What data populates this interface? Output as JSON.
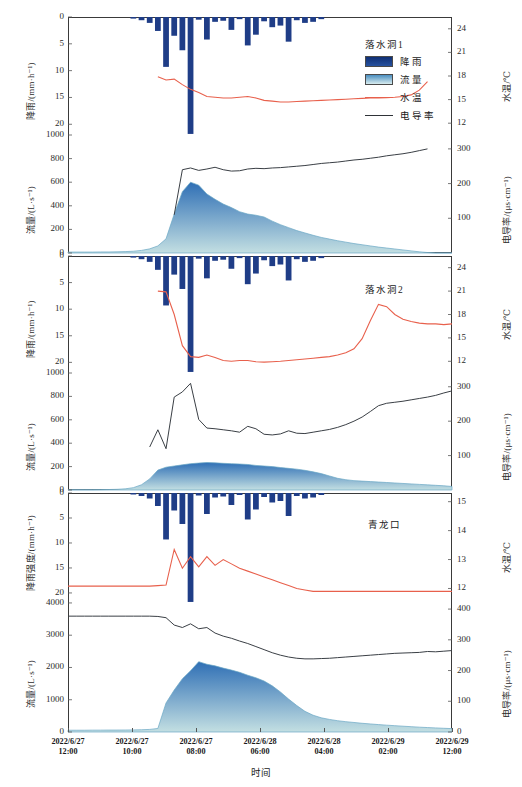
{
  "figure": {
    "width": 522,
    "height": 787,
    "x_axis_title": "时间",
    "x_ticks": [
      {
        "date": "2022/6/27",
        "time": "12:00"
      },
      {
        "date": "2022/6/27",
        "time": "10:00"
      },
      {
        "date": "2022/6/27",
        "time": "08:00"
      },
      {
        "date": "2022/6/28",
        "time": "06:00"
      },
      {
        "date": "2022/6/28",
        "time": "04:00"
      },
      {
        "date": "2022/6/29",
        "time": "02:00"
      },
      {
        "date": "2022/6/29",
        "time": "12:00"
      }
    ],
    "colors": {
      "rainfall": "#1f3d87",
      "flow_top": "#2f6fb5",
      "flow_bottom": "#c3dfe2",
      "water_temp": "#e8604c",
      "conductivity": "#3a3f45",
      "frame": "#3a3a3a"
    }
  },
  "legend": {
    "title": "落水洞1",
    "items": [
      {
        "label": "降雨",
        "type": "swatch",
        "color": "#1f3d87"
      },
      {
        "label": "流量",
        "type": "swatch",
        "color": "#9fcfe0"
      },
      {
        "label": "水温",
        "type": "line",
        "color": "#e8604c"
      },
      {
        "label": "电导率",
        "type": "line",
        "color": "#2f3338"
      }
    ]
  },
  "chart_data": {
    "type": "line",
    "xlabel": "时间",
    "x_range": [
      "2022/6/27 12:00",
      "2022/6/29 12:00"
    ],
    "panels": [
      {
        "name": "落水洞1",
        "axes": {
          "rain": {
            "label": "降雨/(mm·h⁻¹)",
            "ticks": [
              0,
              5,
              10,
              15,
              20
            ],
            "ylim": [
              0,
              22
            ],
            "inverted": true
          },
          "flow": {
            "label": "流量/(L·s⁻¹)",
            "ticks": [
              0,
              200,
              400,
              600,
              800,
              1000
            ],
            "ylim": [
              0,
              1000
            ]
          },
          "temp": {
            "label": "水温/℃",
            "ticks": [
              12,
              15,
              18,
              21,
              24
            ],
            "ylim": [
              10.5,
              25.5
            ],
            "inverted": true
          },
          "cond": {
            "label": "电导率/(μs·cm⁻¹)",
            "ticks": [
              100,
              200,
              300
            ],
            "ylim": [
              0,
              340
            ]
          }
        },
        "series": {
          "rainfall": {
            "unit": "mm/h",
            "values": [
              0,
              0,
              0,
              0,
              0,
              0,
              0,
              0,
              0.3,
              0.6,
              1.1,
              2.6,
              9.3,
              3.5,
              6.2,
              21.8,
              0.5,
              4.2,
              0.9,
              0.7,
              2.4,
              0.4,
              5.3,
              3.3,
              0.8,
              1.9,
              1.6,
              4.6,
              0.6,
              1.1,
              0.9,
              0.4,
              0,
              0,
              0,
              0,
              0,
              0,
              0,
              0,
              0,
              0,
              0,
              0,
              0,
              0,
              0,
              0
            ]
          },
          "flow": {
            "unit": "L/s",
            "values": [
              8,
              8,
              8,
              8,
              9,
              9,
              10,
              12,
              15,
              22,
              35,
              60,
              120,
              330,
              520,
              600,
              575,
              500,
              455,
              415,
              385,
              350,
              330,
              320,
              305,
              270,
              240,
              215,
              190,
              170,
              150,
              132,
              118,
              104,
              92,
              80,
              70,
              60,
              50,
              42,
              34,
              26,
              18,
              10,
              4,
              0,
              0,
              0
            ]
          },
          "water_temp": {
            "unit": "℃",
            "values": [
              null,
              null,
              null,
              null,
              null,
              null,
              null,
              null,
              null,
              null,
              null,
              17.9,
              17.5,
              17.6,
              16.9,
              16.3,
              15.9,
              15.4,
              15.3,
              15.2,
              15.2,
              15.3,
              15.4,
              15.2,
              14.9,
              14.8,
              14.7,
              14.7,
              14.75,
              14.8,
              14.85,
              14.9,
              14.95,
              15.0,
              15.05,
              15.1,
              15.15,
              15.2,
              15.2,
              15.25,
              15.3,
              15.4,
              15.6,
              16.2,
              17.3,
              null,
              null,
              null
            ]
          },
          "conductivity": {
            "unit": "μs/cm",
            "values": [
              null,
              null,
              null,
              null,
              null,
              null,
              null,
              null,
              null,
              null,
              null,
              null,
              null,
              110,
              240,
              245,
              238,
              242,
              247,
              240,
              236,
              237,
              242,
              244,
              243,
              245,
              246,
              248,
              250,
              252,
              255,
              258,
              260,
              262,
              265,
              268,
              270,
              273,
              276,
              280,
              283,
              286,
              290,
              295,
              300,
              null,
              null,
              null
            ]
          }
        }
      },
      {
        "name": "落水洞2",
        "axes": {
          "rain": {
            "label": "降雨/(mm·h⁻¹)",
            "ticks": [
              0,
              5,
              10,
              15,
              20
            ],
            "ylim": [
              0,
              22
            ],
            "inverted": true
          },
          "flow": {
            "label": "流量/(L·s⁻¹)",
            "ticks": [
              0,
              200,
              400,
              600,
              800,
              1000
            ],
            "ylim": [
              0,
              1000
            ]
          },
          "temp": {
            "label": "水温/℃",
            "ticks": [
              12,
              15,
              18,
              21,
              24
            ],
            "ylim": [
              10.5,
              25.5
            ],
            "inverted": true
          },
          "cond": {
            "label": "电导率/(μs·cm⁻¹)",
            "ticks": [
              100,
              200,
              300
            ],
            "ylim": [
              0,
              340
            ]
          }
        },
        "series": {
          "rainfall": {
            "unit": "mm/h",
            "values": [
              0,
              0,
              0,
              0,
              0,
              0,
              0,
              0,
              0.3,
              0.6,
              1.1,
              2.6,
              9.3,
              3.5,
              6.2,
              21.8,
              0.5,
              4.2,
              0.9,
              0.7,
              2.4,
              0.4,
              5.3,
              3.3,
              0.8,
              1.9,
              1.6,
              4.6,
              0.6,
              1.1,
              0.9,
              0.4,
              0,
              0,
              0,
              0,
              0,
              0,
              0,
              0,
              0,
              0,
              0,
              0,
              0,
              0,
              0,
              0
            ]
          },
          "flow": {
            "unit": "L/s",
            "values": [
              2,
              2,
              2,
              2,
              3,
              4,
              6,
              10,
              20,
              45,
              95,
              170,
              195,
              205,
              215,
              225,
              230,
              235,
              232,
              228,
              225,
              222,
              218,
              210,
              205,
              200,
              192,
              185,
              178,
              168,
              155,
              140,
              120,
              100,
              88,
              80,
              76,
              72,
              68,
              64,
              60,
              56,
              52,
              48,
              44,
              40,
              36,
              30
            ]
          },
          "water_temp": {
            "unit": "℃",
            "values": [
              null,
              null,
              null,
              null,
              null,
              null,
              null,
              null,
              null,
              null,
              null,
              21.0,
              20.9,
              18.0,
              14.0,
              12.6,
              12.5,
              12.8,
              12.5,
              12.1,
              12.0,
              12.1,
              12.1,
              11.95,
              11.9,
              11.95,
              12.0,
              12.1,
              12.2,
              12.3,
              12.4,
              12.5,
              12.6,
              12.8,
              13.1,
              13.6,
              14.9,
              17.2,
              19.3,
              19.0,
              18.0,
              17.4,
              17.1,
              16.9,
              16.8,
              16.8,
              16.7,
              16.8
            ]
          },
          "conductivity": {
            "unit": "μs/cm",
            "values": [
              null,
              null,
              null,
              null,
              null,
              null,
              null,
              null,
              null,
              null,
              125,
              175,
              120,
              270,
              285,
              310,
              205,
              180,
              178,
              175,
              172,
              168,
              185,
              178,
              162,
              160,
              163,
              172,
              165,
              164,
              168,
              172,
              176,
              182,
              190,
              200,
              212,
              228,
              245,
              252,
              255,
              258,
              262,
              266,
              270,
              275,
              282,
              288
            ]
          }
        }
      },
      {
        "name": "青龙口",
        "axes": {
          "rain": {
            "label": "降雨强度/(mm·h⁻¹)",
            "ticks": [
              0,
              5,
              10,
              15,
              20
            ],
            "ylim": [
              0,
              22
            ],
            "inverted": true
          },
          "flow": {
            "label": "流量/(L·s⁻¹)",
            "ticks": [
              0,
              1000,
              2000,
              3000,
              4000
            ],
            "ylim": [
              0,
              4000
            ]
          },
          "temp": {
            "label": "水温/℃",
            "ticks": [
              12,
              13,
              14,
              15
            ],
            "ylim": [
              11.5,
              15.3
            ],
            "inverted": true
          },
          "cond": {
            "label": "电导率/(μs·cm⁻¹)",
            "ticks": [
              0,
              100,
              200,
              300,
              400
            ],
            "ylim": [
              0,
              420
            ]
          }
        },
        "series": {
          "rainfall": {
            "unit": "mm/h",
            "values": [
              0,
              0,
              0,
              0,
              0,
              0,
              0,
              0,
              0.3,
              0.6,
              1.1,
              2.6,
              9.3,
              3.5,
              6.2,
              21.8,
              0.5,
              4.2,
              0.9,
              0.7,
              2.4,
              0.4,
              5.3,
              3.3,
              0.8,
              1.9,
              1.6,
              4.6,
              0.6,
              1.1,
              0.9,
              0.4,
              0,
              0,
              0,
              0,
              0,
              0,
              0,
              0,
              0,
              0,
              0,
              0,
              0,
              0,
              0,
              0
            ]
          },
          "flow": {
            "unit": "L/s",
            "values": [
              55,
              55,
              55,
              58,
              58,
              60,
              60,
              62,
              65,
              70,
              80,
              110,
              900,
              1300,
              1650,
              1900,
              2180,
              2100,
              2050,
              1980,
              1920,
              1850,
              1760,
              1680,
              1580,
              1430,
              1240,
              1020,
              820,
              640,
              520,
              440,
              390,
              350,
              320,
              295,
              270,
              250,
              230,
              212,
              196,
              180,
              165,
              150,
              138,
              126,
              115,
              105
            ]
          },
          "water_temp": {
            "unit": "℃",
            "values": [
              12.08,
              12.08,
              12.08,
              12.08,
              12.08,
              12.08,
              12.08,
              12.08,
              12.08,
              12.08,
              12.08,
              12.1,
              12.12,
              13.35,
              12.7,
              13.1,
              12.75,
              13.1,
              12.8,
              13.0,
              12.85,
              12.7,
              12.6,
              12.5,
              12.4,
              12.3,
              12.2,
              12.1,
              12.0,
              11.95,
              11.9,
              11.9,
              11.9,
              11.9,
              11.9,
              11.9,
              11.9,
              11.9,
              11.9,
              11.9,
              11.9,
              11.9,
              11.9,
              11.9,
              11.9,
              11.9,
              11.9,
              11.9
            ]
          },
          "conductivity": {
            "unit": "μs/cm",
            "values": [
              377,
              377,
              377,
              377,
              377,
              377,
              377,
              377,
              377,
              377,
              377,
              376,
              372,
              348,
              340,
              352,
              336,
              340,
              322,
              312,
              305,
              296,
              288,
              278,
              268,
              258,
              250,
              244,
              240,
              238,
              238,
              239,
              240,
              242,
              244,
              246,
              248,
              250,
              252,
              254,
              256,
              257,
              258,
              259,
              262,
              261,
              263,
              265
            ]
          }
        }
      }
    ]
  }
}
